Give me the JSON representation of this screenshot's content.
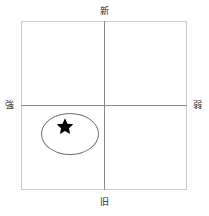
{
  "diagram": {
    "type": "two-axis positioning matrix",
    "axes": {
      "top_label": "新",
      "bottom_label": "旧",
      "left_label": "強",
      "right_label": "弱"
    },
    "colors": {
      "frame": "#cdcdcd",
      "axis": "#8a8a8a",
      "cluster_outline": "#6e6e6e",
      "marker": "#000000",
      "background": "#ffffff"
    },
    "marker": {
      "name": "star-marker",
      "glyph": "★",
      "quadrant": "lower-left"
    },
    "cluster": {
      "name": "cluster-ellipse",
      "quadrant": "lower-left"
    }
  }
}
